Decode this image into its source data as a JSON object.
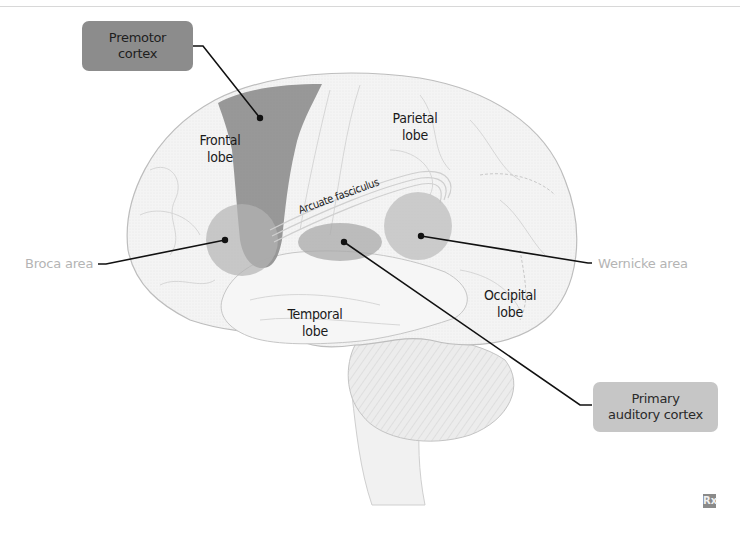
{
  "diagram": {
    "callouts": {
      "premotor_cortex": {
        "line1": "Premotor",
        "line2": "cortex",
        "color": "#8c8c8c"
      },
      "primary_auditory_cortex": {
        "line1": "Primary",
        "line2": "auditory cortex",
        "color": "#c6c6c6"
      }
    },
    "side_labels": {
      "broca_area": "Broca area",
      "wernicke_area": "Wernicke area"
    },
    "lobes": {
      "frontal": {
        "line1": "Frontal",
        "line2": "lobe"
      },
      "parietal": {
        "line1": "Parietal",
        "line2": "lobe"
      },
      "temporal": {
        "line1": "Temporal",
        "line2": "lobe"
      },
      "occipital": {
        "line1": "Occipital",
        "line2": "lobe"
      }
    },
    "tract_label": "Arcuate fasciculus",
    "logo": "Rx",
    "colors": {
      "brain_fill": "#f3f3f3",
      "brain_outline": "#bdbdbd",
      "premotor_region": "#8f8f8f",
      "broca_region": "#b9b9b9",
      "auditory_region": "#b0b0b0",
      "wernicke_region": "#c2c2c2",
      "leader_lines": "#111111",
      "side_label_text": "#b4b4b4"
    }
  }
}
